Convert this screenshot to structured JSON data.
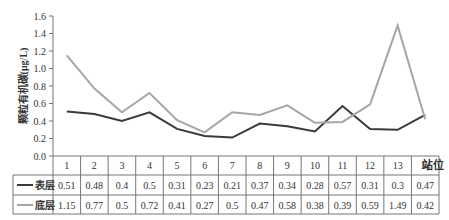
{
  "chart_data": {
    "type": "line",
    "title": "",
    "xlabel": "站位",
    "ylabel": "颗粒有机碳(μg/L)",
    "ylim": [
      0,
      1.6
    ],
    "yticks": [
      "0.0",
      "0.2",
      "0.4",
      "0.6",
      "0.8",
      "1.0",
      "1.2",
      "1.4",
      "1.6"
    ],
    "categories": [
      "1",
      "2",
      "3",
      "4",
      "5",
      "6",
      "7",
      "8",
      "9",
      "10",
      "11",
      "12",
      "13",
      "14"
    ],
    "series": [
      {
        "name": "表层",
        "color": "#3a3a3a",
        "values": [
          0.51,
          0.48,
          0.4,
          0.5,
          0.31,
          0.23,
          0.21,
          0.37,
          0.34,
          0.28,
          0.57,
          0.31,
          0.3,
          0.47
        ]
      },
      {
        "name": "底层",
        "color": "#a6a6a6",
        "values": [
          1.15,
          0.77,
          0.5,
          0.72,
          0.41,
          0.27,
          0.5,
          0.47,
          0.58,
          0.38,
          0.39,
          0.59,
          1.49,
          0.42
        ]
      }
    ],
    "legend_position": "data-table",
    "grid": false
  }
}
